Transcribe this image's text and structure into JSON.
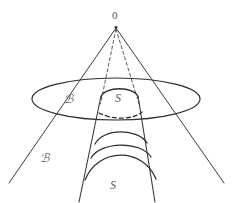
{
  "figure": {
    "type": "geometric-diagram",
    "background_color": "#ffffff",
    "stroke_color": "#3a3a3a",
    "labels": {
      "apex": "0",
      "outer_cross_section": "ℬ",
      "inner_surface_upper": "S",
      "outer_region": "ℬ",
      "inner_surface_lower": "S"
    },
    "geometry": {
      "apex_point": [
        116,
        27
      ],
      "ellipse_center": [
        116,
        99
      ],
      "ellipse_rx": 84,
      "ellipse_ry": 21,
      "cone_left_base": [
        10,
        182
      ],
      "cone_right_base": [
        223,
        182
      ],
      "inner_cone_left": [
        101,
        96
      ],
      "inner_cone_right": [
        137,
        96
      ],
      "tube_left_bottom": [
        79,
        200
      ],
      "tube_right_bottom": [
        153,
        200
      ],
      "arc_count": 4
    },
    "stroke_widths": {
      "cone_lines": 1,
      "ellipse": 1.2,
      "dashed": 1,
      "arcs": 1.3
    }
  }
}
